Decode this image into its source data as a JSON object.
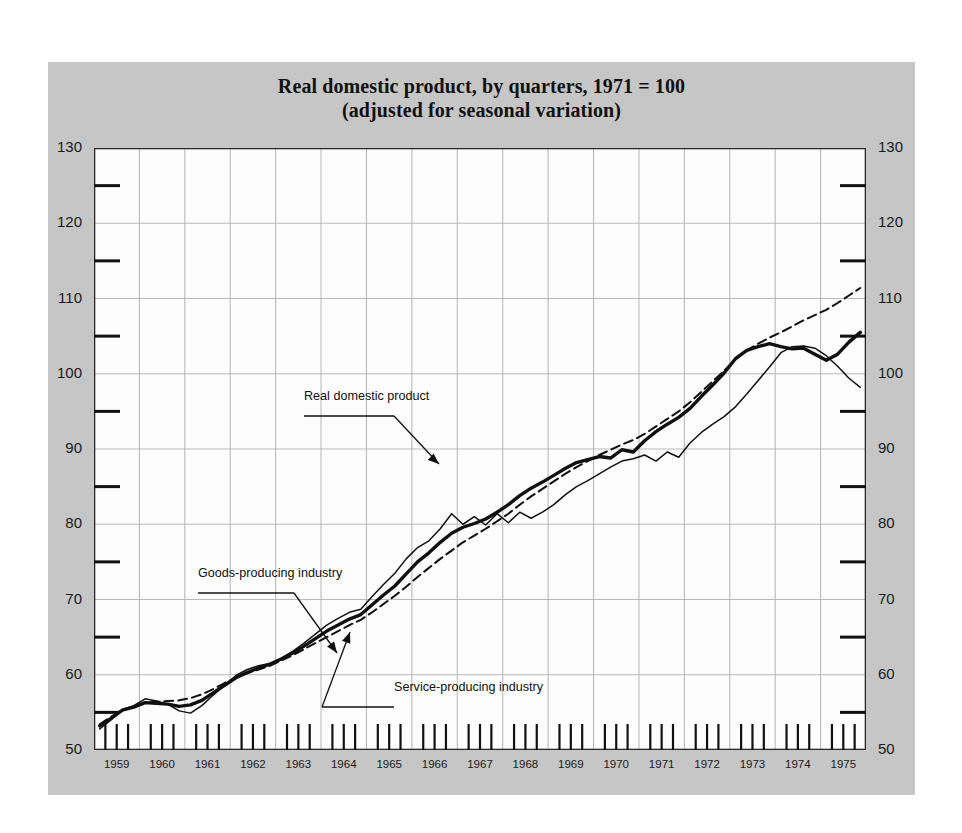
{
  "figure": {
    "background_color": "#c6c6c6",
    "plot_background_color": "#fdfdfd",
    "grid_color": "#b9b9b9",
    "line_color": "#101010"
  },
  "title": {
    "line1": "Real domestic product, by quarters, 1971 = 100",
    "line2": "(adjusted for seasonal variation)"
  },
  "annotations": [
    {
      "id": "rdp",
      "label": "Real domestic product"
    },
    {
      "id": "goods",
      "label": "Goods-producing industry"
    },
    {
      "id": "service",
      "label": "Service-producing industry"
    }
  ],
  "chart_data": {
    "type": "line",
    "title": "Real domestic product, by quarters, 1971 = 100 (adjusted for seasonal variation)",
    "subtitle": "(adjusted for seasonal variation)",
    "xlabel": "",
    "ylabel": "",
    "index_base": "1971 = 100",
    "frequency": "quarterly",
    "grid": true,
    "legend": "annotations-on-plot",
    "xlim": [
      1958.875,
      1975.875
    ],
    "ylim": [
      50,
      130
    ],
    "yticks": [
      50,
      60,
      70,
      80,
      90,
      100,
      110,
      120,
      130
    ],
    "yticks_minor": [
      55,
      65,
      75,
      85,
      95,
      105,
      115,
      125
    ],
    "xticks": [
      1959,
      1960,
      1961,
      1962,
      1963,
      1964,
      1965,
      1966,
      1967,
      1968,
      1969,
      1970,
      1971,
      1972,
      1973,
      1974,
      1975
    ],
    "xtick_labels": [
      "1959",
      "1960",
      "1961",
      "1962",
      "1963",
      "1964",
      "1965",
      "1966",
      "1967",
      "1968",
      "1969",
      "1970",
      "1971",
      "1972",
      "1973",
      "1974",
      "1975"
    ],
    "x_quarters": [
      1959.0,
      1959.25,
      1959.5,
      1959.75,
      1960.0,
      1960.25,
      1960.5,
      1960.75,
      1961.0,
      1961.25,
      1961.5,
      1961.75,
      1962.0,
      1962.25,
      1962.5,
      1962.75,
      1963.0,
      1963.25,
      1963.5,
      1963.75,
      1964.0,
      1964.25,
      1964.5,
      1964.75,
      1965.0,
      1965.25,
      1965.5,
      1965.75,
      1966.0,
      1966.25,
      1966.5,
      1966.75,
      1967.0,
      1967.25,
      1967.5,
      1967.75,
      1968.0,
      1968.25,
      1968.5,
      1968.75,
      1969.0,
      1969.25,
      1969.5,
      1969.75,
      1970.0,
      1970.25,
      1970.5,
      1970.75,
      1971.0,
      1971.25,
      1971.5,
      1971.75,
      1972.0,
      1972.25,
      1972.5,
      1972.75,
      1973.0,
      1973.25,
      1973.5,
      1973.75,
      1974.0,
      1974.25,
      1974.5,
      1974.75,
      1975.0,
      1975.25,
      1975.5,
      1975.75
    ],
    "series": [
      {
        "name": "Real domestic product",
        "style": "solid-thick",
        "values": [
          53.2,
          54.2,
          55.3,
          55.7,
          56.3,
          56.2,
          56.1,
          55.8,
          56.0,
          56.6,
          57.6,
          58.6,
          59.6,
          60.3,
          60.9,
          61.4,
          62.1,
          62.9,
          63.8,
          64.8,
          65.8,
          66.6,
          67.4,
          68.0,
          69.3,
          70.6,
          71.8,
          73.4,
          75.0,
          76.2,
          77.6,
          78.8,
          79.6,
          80.1,
          80.7,
          81.6,
          82.6,
          83.8,
          84.8,
          85.6,
          86.5,
          87.4,
          88.2,
          88.6,
          89.0,
          88.8,
          89.9,
          89.6,
          91.1,
          92.3,
          93.3,
          94.2,
          95.4,
          97.0,
          98.5,
          100.1,
          102.0,
          103.1,
          103.6,
          104.0,
          103.6,
          103.3,
          103.4,
          102.6,
          101.8,
          102.6,
          104.2,
          105.5
        ]
      },
      {
        "name": "Goods-producing industry",
        "style": "solid-thin",
        "values": [
          52.8,
          54.0,
          55.4,
          55.9,
          56.8,
          56.5,
          56.1,
          55.2,
          54.9,
          55.9,
          57.3,
          58.6,
          59.9,
          60.7,
          61.2,
          61.5,
          62.2,
          63.1,
          64.2,
          65.4,
          66.6,
          67.5,
          68.3,
          68.7,
          70.4,
          72.0,
          73.5,
          75.4,
          76.9,
          77.8,
          79.4,
          81.4,
          80.0,
          81.0,
          79.9,
          81.4,
          80.2,
          81.6,
          80.8,
          81.6,
          82.6,
          83.9,
          85.0,
          85.8,
          86.7,
          87.6,
          88.4,
          88.7,
          89.2,
          88.4,
          89.6,
          88.9,
          90.8,
          92.2,
          93.3,
          94.3,
          95.6,
          97.3,
          99.1,
          100.9,
          102.8,
          103.6,
          103.7,
          103.4,
          102.4,
          101.0,
          99.4,
          98.2
        ]
      },
      {
        "name": "Service-producing industry",
        "style": "dashed",
        "values": [
          53.4,
          54.4,
          55.3,
          55.8,
          56.3,
          56.4,
          56.5,
          56.6,
          56.9,
          57.4,
          58.1,
          58.9,
          59.6,
          60.2,
          60.7,
          61.2,
          61.9,
          62.6,
          63.4,
          64.2,
          65.0,
          65.8,
          66.6,
          67.3,
          68.3,
          69.4,
          70.5,
          71.7,
          73.0,
          74.2,
          75.4,
          76.5,
          77.6,
          78.5,
          79.4,
          80.4,
          81.4,
          82.6,
          83.7,
          84.7,
          85.7,
          86.7,
          87.6,
          88.4,
          89.2,
          89.9,
          90.6,
          91.2,
          92.0,
          93.0,
          94.0,
          95.0,
          96.2,
          97.6,
          99.0,
          100.4,
          101.9,
          103.1,
          104.0,
          104.8,
          105.5,
          106.3,
          107.1,
          107.8,
          108.5,
          109.4,
          110.4,
          111.4
        ]
      }
    ]
  }
}
